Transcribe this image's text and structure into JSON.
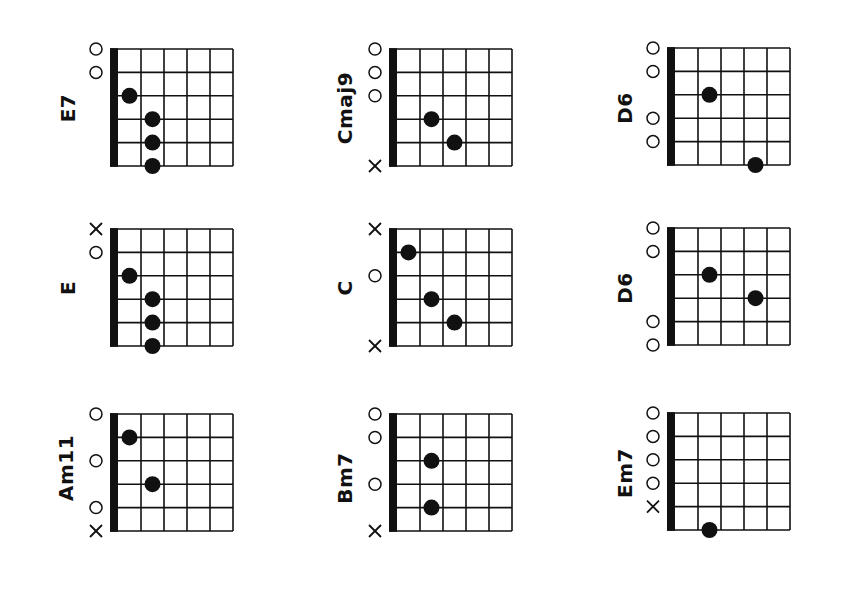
{
  "page": {
    "background": "#ffffff",
    "ink_color": "#111111"
  },
  "layout": {
    "orientation": "rotated-90-ccw",
    "strings_per_diagram": 6,
    "frets_shown": 5,
    "string_spacing_px": 23.4,
    "fret_spacing_px": 23,
    "nut_width_px": 8
  },
  "chords": [
    {
      "name": "E7",
      "origin": [
        110,
        49
      ],
      "label_pos": [
        68,
        108
      ],
      "markers": [
        {
          "string": 0,
          "type": "open"
        },
        {
          "string": 1,
          "type": "open"
        }
      ],
      "dots": [
        {
          "string": 2,
          "fret": 1
        },
        {
          "string": 3,
          "fret": 2
        },
        {
          "string": 4,
          "fret": 2
        },
        {
          "string": 5,
          "fret": 2
        }
      ]
    },
    {
      "name": "Cmaj9",
      "origin": [
        389,
        49
      ],
      "label_pos": [
        345,
        108
      ],
      "markers": [
        {
          "string": 0,
          "type": "open"
        },
        {
          "string": 1,
          "type": "open"
        },
        {
          "string": 2,
          "type": "open"
        },
        {
          "string": 5,
          "type": "muted"
        }
      ],
      "dots": [
        {
          "string": 3,
          "fret": 2
        },
        {
          "string": 4,
          "fret": 3
        }
      ]
    },
    {
      "name": "D6",
      "origin": [
        667,
        48
      ],
      "label_pos": [
        625,
        108
      ],
      "markers": [
        {
          "string": 0,
          "type": "open"
        },
        {
          "string": 1,
          "type": "open"
        },
        {
          "string": 3,
          "type": "open"
        },
        {
          "string": 4,
          "type": "open"
        }
      ],
      "dots": [
        {
          "string": 2,
          "fret": 2
        },
        {
          "string": 5,
          "fret": 4
        }
      ]
    },
    {
      "name": "E",
      "origin": [
        110,
        229
      ],
      "label_pos": [
        68,
        288
      ],
      "markers": [
        {
          "string": 0,
          "type": "muted"
        },
        {
          "string": 1,
          "type": "open"
        }
      ],
      "dots": [
        {
          "string": 2,
          "fret": 1
        },
        {
          "string": 3,
          "fret": 2
        },
        {
          "string": 4,
          "fret": 2
        },
        {
          "string": 5,
          "fret": 2
        }
      ]
    },
    {
      "name": "C",
      "origin": [
        389,
        229
      ],
      "label_pos": [
        345,
        288
      ],
      "markers": [
        {
          "string": 0,
          "type": "muted"
        },
        {
          "string": 2,
          "type": "open"
        },
        {
          "string": 5,
          "type": "muted"
        }
      ],
      "dots": [
        {
          "string": 1,
          "fret": 1
        },
        {
          "string": 3,
          "fret": 2
        },
        {
          "string": 4,
          "fret": 3
        }
      ]
    },
    {
      "name": "D6",
      "origin": [
        667,
        228
      ],
      "label_pos": [
        625,
        288
      ],
      "markers": [
        {
          "string": 0,
          "type": "open"
        },
        {
          "string": 1,
          "type": "open"
        },
        {
          "string": 4,
          "type": "open"
        },
        {
          "string": 5,
          "type": "open"
        }
      ],
      "dots": [
        {
          "string": 2,
          "fret": 2
        },
        {
          "string": 3,
          "fret": 4
        }
      ]
    },
    {
      "name": "Am11",
      "origin": [
        110,
        414
      ],
      "label_pos": [
        66,
        468
      ],
      "markers": [
        {
          "string": 0,
          "type": "open"
        },
        {
          "string": 2,
          "type": "open"
        },
        {
          "string": 4,
          "type": "open"
        },
        {
          "string": 5,
          "type": "muted"
        }
      ],
      "dots": [
        {
          "string": 1,
          "fret": 1
        },
        {
          "string": 3,
          "fret": 2
        }
      ]
    },
    {
      "name": "Bm7",
      "origin": [
        389,
        414
      ],
      "label_pos": [
        345,
        478
      ],
      "markers": [
        {
          "string": 0,
          "type": "open"
        },
        {
          "string": 1,
          "type": "open"
        },
        {
          "string": 3,
          "type": "open"
        },
        {
          "string": 5,
          "type": "muted"
        }
      ],
      "dots": [
        {
          "string": 2,
          "fret": 2
        },
        {
          "string": 4,
          "fret": 2
        }
      ]
    },
    {
      "name": "Em7",
      "origin": [
        667,
        413
      ],
      "label_pos": [
        625,
        473
      ],
      "markers": [
        {
          "string": 0,
          "type": "open"
        },
        {
          "string": 1,
          "type": "open"
        },
        {
          "string": 2,
          "type": "open"
        },
        {
          "string": 3,
          "type": "open"
        },
        {
          "string": 4,
          "type": "muted"
        }
      ],
      "dots": [
        {
          "string": 5,
          "fret": 2
        }
      ]
    }
  ]
}
